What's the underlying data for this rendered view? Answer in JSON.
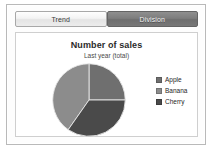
{
  "window": {
    "title": "Number of sales"
  },
  "tabs": [
    {
      "label": "Trend",
      "state": "inactive"
    },
    {
      "label": "Division",
      "state": "active"
    }
  ],
  "chart_data": {
    "type": "pie",
    "title": "Number of sales",
    "subtitle": "Last year (total)",
    "xlabel": "",
    "ylabel": "",
    "legend_position": "right",
    "grid": false,
    "categories": [
      "Apple",
      "Banana",
      "Cherry"
    ],
    "values": [
      25,
      40,
      35
    ],
    "slices": [
      {
        "label": "Apple",
        "percent": 25,
        "color": "#6f6f6f",
        "start_angle": 0,
        "end_angle": 90
      },
      {
        "label": "Banana",
        "percent": 40,
        "color": "#8c8c8c",
        "start_angle": 215,
        "end_angle": 360
      },
      {
        "label": "Cherry",
        "percent": 35,
        "color": "#4a4a4a",
        "start_angle": 90,
        "end_angle": 215
      }
    ]
  },
  "legend": {
    "items": [
      {
        "label": "Apple",
        "color": "#6f6f6f"
      },
      {
        "label": "Banana",
        "color": "#8c8c8c"
      },
      {
        "label": "Cherry",
        "color": "#4a4a4a"
      }
    ]
  },
  "colors": {
    "window_border": "#b9b9b9",
    "panel_border": "#cfcfcf",
    "tab_active_bg": "#7d7d7d",
    "tab_inactive_bg": "#f0f0f0",
    "slice_divider": "#e8e8e8"
  }
}
